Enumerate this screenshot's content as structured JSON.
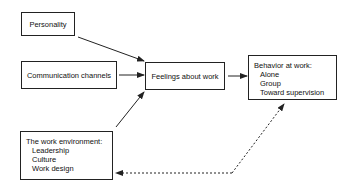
{
  "diagram": {
    "nodes": {
      "personality": {
        "label": "Personality"
      },
      "communication": {
        "label": "Communication channels"
      },
      "feelings": {
        "label": "Feelings about work"
      },
      "behavior": {
        "label": "Behavior at work:",
        "items": [
          "Alone",
          "Group",
          "Toward supervision"
        ]
      },
      "environment": {
        "label": "The work environment:",
        "items": [
          "Leadership",
          "Culture",
          "Work design"
        ]
      }
    },
    "edges": [
      {
        "from": "personality",
        "to": "feelings",
        "style": "solid"
      },
      {
        "from": "communication",
        "to": "feelings",
        "style": "solid"
      },
      {
        "from": "environment",
        "to": "feelings",
        "style": "solid"
      },
      {
        "from": "feelings",
        "to": "behavior",
        "style": "solid"
      },
      {
        "from": "behavior",
        "to": "environment",
        "style": "dashed",
        "bidirectional": true
      }
    ],
    "colors": {
      "stroke": "#222222",
      "background": "#ffffff"
    }
  }
}
